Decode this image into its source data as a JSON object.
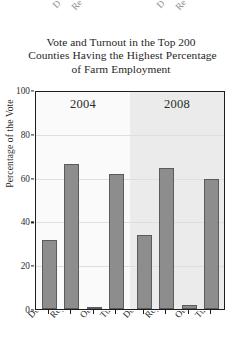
{
  "chart_data": {
    "type": "bar",
    "title": "Vote and Turnout in the Top 200 Counties Having the Highest Percentage of Farm Employment",
    "title_lines": [
      "Vote and Turnout in the Top 200",
      "Counties Having the Highest Percentage",
      "of Farm Employment"
    ],
    "xlabel": "",
    "ylabel": "Percentage of the Vote",
    "ylim": [
      0,
      100
    ],
    "yticks": [
      0,
      20,
      40,
      60,
      80,
      100
    ],
    "ytick_labels": [
      "0",
      "20",
      "40",
      "60",
      "80",
      "100"
    ],
    "grid": true,
    "grid_axis": "y",
    "legend": "none",
    "panels": [
      {
        "label": "2004",
        "categories": [
          "Democrat",
          "Republican",
          "Other",
          "Turnout"
        ],
        "values": [
          32,
          67,
          1,
          62
        ]
      },
      {
        "label": "2008",
        "categories": [
          "Democrat",
          "Republican",
          "Other",
          "Turnout"
        ],
        "values": [
          34,
          65,
          2,
          60
        ]
      }
    ],
    "bar_color": "#8d8d8d",
    "bar_edge_color": "#5b5b5b",
    "panel_backgrounds": [
      "#fafafa",
      "#ebebeb"
    ],
    "frame_color": "#1d1d1d",
    "gridline_color": "#dedede",
    "x_label_rotation": -47
  },
  "clipped_labels_above": [
    {
      "text": "D",
      "x": 58,
      "y": 24
    },
    {
      "text": "Re",
      "x": 78,
      "y": 26
    },
    {
      "text": "D",
      "x": 162,
      "y": 24
    },
    {
      "text": "Re",
      "x": 182,
      "y": 26
    }
  ]
}
